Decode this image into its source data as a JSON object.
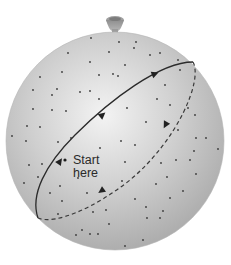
{
  "diagram": {
    "label": {
      "line1": "Start",
      "line2": "here"
    },
    "colors": {
      "background": "#ffffff",
      "sphere_light": "#f1f1f1",
      "sphere_mid": "#c9c9c9",
      "sphere_dark": "#a9a9a9",
      "knot": "#9a9a9a",
      "path": "#2b2b2b",
      "dots": "#333333"
    },
    "path": {
      "front_style": "solid",
      "back_style": "dashed",
      "front_arrows": 3,
      "back_arrows": 2
    }
  }
}
